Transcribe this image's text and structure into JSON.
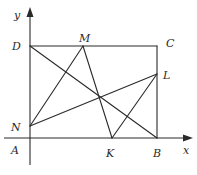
{
  "diagram": {
    "type": "geometry",
    "axes": {
      "x_label": "x",
      "y_label": "y"
    },
    "points": {
      "A": {
        "label": "A",
        "x": 30,
        "y": 138
      },
      "B": {
        "label": "B",
        "x": 157,
        "y": 138
      },
      "C": {
        "label": "C",
        "x": 157,
        "y": 46
      },
      "D": {
        "label": "D",
        "x": 30,
        "y": 46
      },
      "M": {
        "label": "M",
        "x": 83,
        "y": 46
      },
      "L": {
        "label": "L",
        "x": 157,
        "y": 74
      },
      "N": {
        "label": "N",
        "x": 30,
        "y": 126
      },
      "K": {
        "label": "K",
        "x": 112,
        "y": 138
      }
    },
    "segments": [
      [
        "D",
        "C"
      ],
      [
        "C",
        "B"
      ],
      [
        "D",
        "B"
      ],
      [
        "N",
        "M"
      ],
      [
        "N",
        "L"
      ],
      [
        "M",
        "K"
      ],
      [
        "K",
        "L"
      ]
    ],
    "colors": {
      "stroke": "#2a2a2a",
      "background": "#ffffff"
    }
  }
}
